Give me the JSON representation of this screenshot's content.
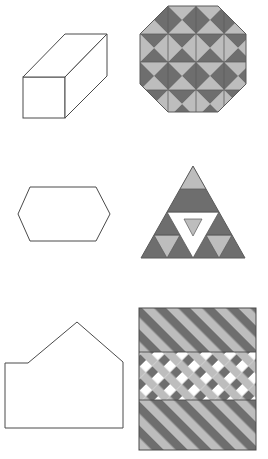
{
  "page": {
    "background_color": "#ffffff",
    "width": 268,
    "height": 459
  },
  "palette": {
    "outline": "#4a4a4a",
    "outline_width": "1",
    "dark_gray": "#6e6e6e",
    "light_gray": "#bdbdbd",
    "white": "#ffffff",
    "seam": "#5a5a5a"
  },
  "panels": [
    {
      "id": "panel-1",
      "row": 1,
      "column": "left",
      "kind": "outline-shape",
      "shape_name": "rectangular-prism",
      "label": "Rectangular prism (cuboid) line drawing",
      "fill": "#ffffff",
      "stroke": "#4a4a4a"
    },
    {
      "id": "panel-2",
      "row": 1,
      "column": "right",
      "kind": "shaded-pattern",
      "shape_name": "octagon-triangle-tiling",
      "label": "Octagon filled with a 4x4 grid of quartered squares, each split into four triangles alternating dark and light gray",
      "grid": "4x4",
      "colors": [
        "#6e6e6e",
        "#bdbdbd"
      ]
    },
    {
      "id": "panel-3",
      "row": 2,
      "column": "left",
      "kind": "outline-shape",
      "shape_name": "elongated-hexagon",
      "label": "Elongated horizontal hexagon line drawing",
      "fill": "#ffffff",
      "stroke": "#4a4a4a"
    },
    {
      "id": "panel-4",
      "row": 2,
      "column": "right",
      "kind": "shaded-pattern",
      "shape_name": "sierpinski-triangle",
      "label": "Equilateral triangle subdivided Sierpinski-style with dark gray, light gray and white sub-triangles",
      "levels": 3,
      "colors": [
        "#6e6e6e",
        "#bdbdbd",
        "#ffffff"
      ]
    },
    {
      "id": "panel-5",
      "row": 3,
      "column": "left",
      "kind": "outline-shape",
      "shape_name": "house-pentagon",
      "label": "Irregular house-like polygon line drawing with peaked roof and stepped left side",
      "fill": "#ffffff",
      "stroke": "#4a4a4a"
    },
    {
      "id": "panel-6",
      "row": 3,
      "column": "right",
      "kind": "shaded-pattern",
      "shape_name": "diagonal-stripe-square",
      "label": "Square of diagonal stripes in three horizontal bands; top and bottom bands alternate dark and light gray stripes, the middle band adds a crossing white lattice",
      "bands": 3,
      "stripe_direction": "diagonal-down-right",
      "colors": [
        "#6e6e6e",
        "#bdbdbd",
        "#ffffff"
      ]
    }
  ]
}
